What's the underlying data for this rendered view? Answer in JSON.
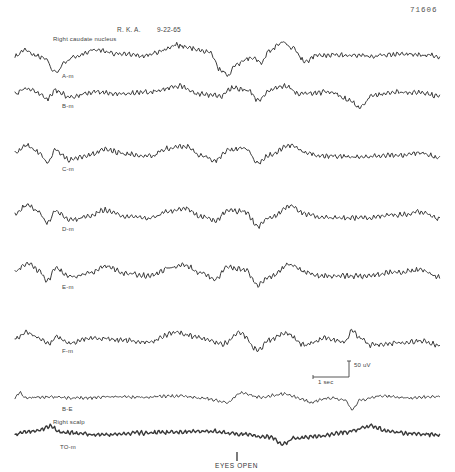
{
  "figure": {
    "figure_number": "71606",
    "patient": "R. K. A.",
    "date": "9-22-65",
    "region_caudate": "Right caudate nucleus",
    "region_scalp": "Right scalp",
    "event_marker": "EYES OPEN",
    "scale_voltage": "50 uV",
    "scale_time": "1 sec",
    "trace_color": "#3a3a3a"
  },
  "chart_data": {
    "type": "line",
    "subtitle": "Right caudate nucleus / Right scalp EEG recording",
    "xlabel": "",
    "ylabel": "",
    "grid": false,
    "legend": "none",
    "scale_bar": {
      "voltage": "50 uV",
      "time": "1 sec"
    },
    "annotations": [
      "EYES OPEN"
    ],
    "x_range_px": [
      15,
      440
    ],
    "series": [
      {
        "name": "A-m",
        "baseline_y": 55,
        "amp": 3.0,
        "wiggle": 2.2,
        "width": 1.0,
        "label_x": 38,
        "label_y": 76,
        "points": [
          [
            15,
            56
          ],
          [
            25,
            50
          ],
          [
            35,
            55
          ],
          [
            48,
            60
          ],
          [
            52,
            70
          ],
          [
            58,
            72
          ],
          [
            64,
            62
          ],
          [
            75,
            57
          ],
          [
            95,
            50
          ],
          [
            120,
            54
          ],
          [
            145,
            56
          ],
          [
            160,
            52
          ],
          [
            175,
            45
          ],
          [
            190,
            48
          ],
          [
            210,
            52
          ],
          [
            220,
            70
          ],
          [
            228,
            75
          ],
          [
            236,
            64
          ],
          [
            250,
            58
          ],
          [
            262,
            62
          ],
          [
            270,
            50
          ],
          [
            283,
            42
          ],
          [
            293,
            48
          ],
          [
            305,
            62
          ],
          [
            315,
            56
          ],
          [
            340,
            55
          ],
          [
            370,
            56
          ],
          [
            400,
            54
          ],
          [
            430,
            55
          ],
          [
            440,
            57
          ]
        ]
      },
      {
        "name": "B-m",
        "baseline_y": 94,
        "amp": 3.0,
        "wiggle": 2.4,
        "width": 1.0,
        "label_x": 62,
        "label_y": 106,
        "points": [
          [
            15,
            94
          ],
          [
            27,
            88
          ],
          [
            38,
            93
          ],
          [
            48,
            99
          ],
          [
            55,
            90
          ],
          [
            70,
            97
          ],
          [
            95,
            92
          ],
          [
            120,
            94
          ],
          [
            150,
            92
          ],
          [
            178,
            86
          ],
          [
            200,
            94
          ],
          [
            222,
            96
          ],
          [
            232,
            88
          ],
          [
            248,
            90
          ],
          [
            258,
            100
          ],
          [
            270,
            90
          ],
          [
            285,
            86
          ],
          [
            300,
            94
          ],
          [
            330,
            92
          ],
          [
            350,
            100
          ],
          [
            360,
            108
          ],
          [
            372,
            96
          ],
          [
            390,
            92
          ],
          [
            420,
            93
          ],
          [
            440,
            96
          ]
        ]
      },
      {
        "name": "C-m",
        "baseline_y": 155,
        "amp": 3.0,
        "wiggle": 2.6,
        "width": 1.0,
        "label_x": 62,
        "label_y": 170,
        "points": [
          [
            15,
            153
          ],
          [
            28,
            145
          ],
          [
            38,
            152
          ],
          [
            48,
            162
          ],
          [
            55,
            150
          ],
          [
            70,
            160
          ],
          [
            90,
            155
          ],
          [
            105,
            149
          ],
          [
            125,
            154
          ],
          [
            150,
            156
          ],
          [
            170,
            148
          ],
          [
            185,
            146
          ],
          [
            200,
            155
          ],
          [
            215,
            160
          ],
          [
            228,
            150
          ],
          [
            245,
            148
          ],
          [
            258,
            163
          ],
          [
            270,
            155
          ],
          [
            290,
            145
          ],
          [
            305,
            152
          ],
          [
            320,
            156
          ],
          [
            360,
            157
          ],
          [
            400,
            155
          ],
          [
            420,
            153
          ],
          [
            440,
            158
          ]
        ]
      },
      {
        "name": "D-m",
        "baseline_y": 215,
        "amp": 3.0,
        "wiggle": 2.6,
        "width": 1.0,
        "label_x": 62,
        "label_y": 230,
        "points": [
          [
            15,
            213
          ],
          [
            28,
            205
          ],
          [
            38,
            212
          ],
          [
            48,
            223
          ],
          [
            55,
            211
          ],
          [
            70,
            220
          ],
          [
            90,
            216
          ],
          [
            105,
            210
          ],
          [
            125,
            216
          ],
          [
            150,
            218
          ],
          [
            170,
            211
          ],
          [
            185,
            208
          ],
          [
            200,
            216
          ],
          [
            215,
            221
          ],
          [
            228,
            210
          ],
          [
            245,
            212
          ],
          [
            258,
            226
          ],
          [
            270,
            218
          ],
          [
            290,
            206
          ],
          [
            305,
            214
          ],
          [
            320,
            218
          ],
          [
            360,
            218
          ],
          [
            400,
            215
          ],
          [
            420,
            212
          ],
          [
            440,
            219
          ]
        ]
      },
      {
        "name": "E-m",
        "baseline_y": 272,
        "amp": 3.0,
        "wiggle": 2.6,
        "width": 1.0,
        "label_x": 62,
        "label_y": 287,
        "points": [
          [
            15,
            271
          ],
          [
            28,
            263
          ],
          [
            38,
            270
          ],
          [
            48,
            281
          ],
          [
            55,
            268
          ],
          [
            70,
            277
          ],
          [
            90,
            273
          ],
          [
            105,
            266
          ],
          [
            125,
            273
          ],
          [
            150,
            276
          ],
          [
            170,
            268
          ],
          [
            185,
            265
          ],
          [
            200,
            273
          ],
          [
            215,
            279
          ],
          [
            228,
            267
          ],
          [
            245,
            270
          ],
          [
            258,
            285
          ],
          [
            270,
            277
          ],
          [
            290,
            264
          ],
          [
            305,
            272
          ],
          [
            320,
            276
          ],
          [
            360,
            276
          ],
          [
            400,
            272
          ],
          [
            420,
            270
          ],
          [
            440,
            277
          ]
        ]
      },
      {
        "name": "F-m",
        "baseline_y": 340,
        "amp": 3.0,
        "wiggle": 2.4,
        "width": 1.0,
        "label_x": 62,
        "label_y": 352,
        "points": [
          [
            15,
            338
          ],
          [
            27,
            332
          ],
          [
            38,
            338
          ],
          [
            50,
            344
          ],
          [
            56,
            336
          ],
          [
            70,
            343
          ],
          [
            90,
            338
          ],
          [
            120,
            340
          ],
          [
            150,
            342
          ],
          [
            175,
            332
          ],
          [
            200,
            338
          ],
          [
            222,
            344
          ],
          [
            240,
            333
          ],
          [
            258,
            350
          ],
          [
            270,
            340
          ],
          [
            285,
            333
          ],
          [
            305,
            345
          ],
          [
            325,
            338
          ],
          [
            345,
            342
          ],
          [
            352,
            330
          ],
          [
            360,
            338
          ],
          [
            370,
            345
          ],
          [
            400,
            343
          ],
          [
            420,
            341
          ],
          [
            440,
            345
          ]
        ]
      },
      {
        "name": "B-E",
        "baseline_y": 397,
        "amp": 2.0,
        "wiggle": 1.6,
        "width": 0.9,
        "label_x": 62,
        "label_y": 410,
        "points": [
          [
            15,
            398
          ],
          [
            20,
            392
          ],
          [
            25,
            398
          ],
          [
            50,
            397
          ],
          [
            80,
            398
          ],
          [
            110,
            397
          ],
          [
            140,
            397
          ],
          [
            180,
            396
          ],
          [
            200,
            398
          ],
          [
            228,
            402
          ],
          [
            240,
            393
          ],
          [
            260,
            397
          ],
          [
            285,
            394
          ],
          [
            300,
            398
          ],
          [
            310,
            402
          ],
          [
            330,
            398
          ],
          [
            345,
            400
          ],
          [
            352,
            410
          ],
          [
            360,
            400
          ],
          [
            380,
            396
          ],
          [
            410,
            398
          ],
          [
            440,
            396
          ]
        ]
      },
      {
        "name": "TO-m",
        "baseline_y": 433,
        "amp": 2.2,
        "wiggle": 2.2,
        "width": 1.4,
        "label_x": 60,
        "label_y": 449,
        "points": [
          [
            15,
            434
          ],
          [
            40,
            430
          ],
          [
            50,
            426
          ],
          [
            60,
            432
          ],
          [
            100,
            435
          ],
          [
            140,
            433
          ],
          [
            180,
            432
          ],
          [
            210,
            431
          ],
          [
            240,
            434
          ],
          [
            270,
            437
          ],
          [
            283,
            444
          ],
          [
            295,
            438
          ],
          [
            320,
            436
          ],
          [
            345,
            432
          ],
          [
            372,
            426
          ],
          [
            390,
            432
          ],
          [
            420,
            434
          ],
          [
            440,
            435
          ]
        ]
      }
    ]
  }
}
